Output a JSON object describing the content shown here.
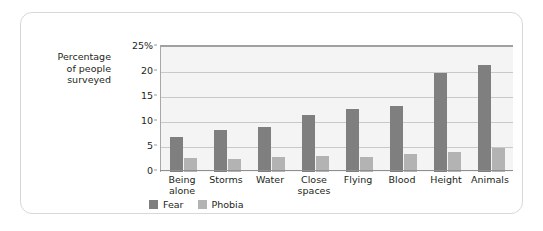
{
  "chart_data": {
    "type": "bar",
    "title": "",
    "xlabel": "",
    "ylabel": "Percentage of people surveyed",
    "ylim": [
      0,
      25
    ],
    "ytick_values": [
      0,
      5,
      10,
      15,
      20,
      25
    ],
    "ytick_labels": [
      "0",
      "5",
      "10",
      "15",
      "20",
      "25%"
    ],
    "grid": true,
    "legend_position": "bottom-left",
    "categories": [
      "Being alone",
      "Storms",
      "Water",
      "Close spaces",
      "Flying",
      "Blood",
      "Height",
      "Animals"
    ],
    "category_lines": [
      [
        "Being",
        "alone"
      ],
      [
        "Storms"
      ],
      [
        "Water"
      ],
      [
        "Close",
        "spaces"
      ],
      [
        "Flying"
      ],
      [
        "Blood"
      ],
      [
        "Height"
      ],
      [
        "Animals"
      ]
    ],
    "series": [
      {
        "name": "Fear",
        "color": "#7f7f7f",
        "values": [
          7.0,
          8.4,
          9.0,
          11.5,
          12.7,
          13.2,
          19.8,
          21.4
        ]
      },
      {
        "name": "Phobia",
        "color": "#b3b3b3",
        "values": [
          2.9,
          2.7,
          3.1,
          3.3,
          3.0,
          3.7,
          4.1,
          4.8
        ]
      }
    ]
  },
  "axis_label": {
    "line1": "Percentage",
    "line2": "of people",
    "line3": "surveyed"
  },
  "colors": {
    "fear": "#7f7f7f",
    "phobia": "#b3b3b3",
    "plot_background": "#f4f4f4",
    "gridline": "#c9c9c9",
    "card_border": "#d8d8d8",
    "text": "#231f20"
  }
}
